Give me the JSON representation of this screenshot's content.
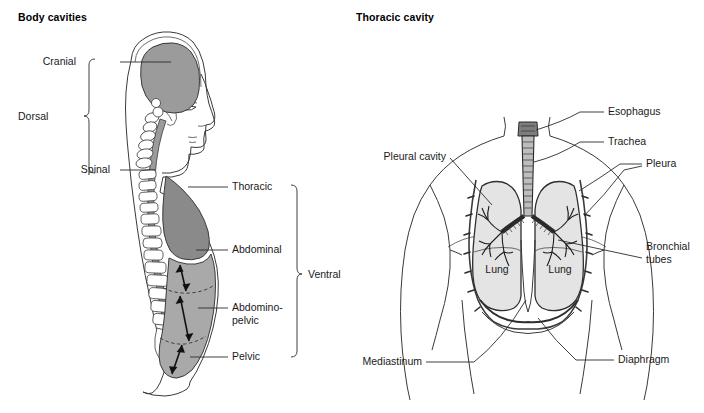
{
  "figure": {
    "type": "anatomical-diagram"
  },
  "panels": {
    "left": {
      "title": "Body cavities",
      "group_labels": [
        {
          "name": "dorsal",
          "text": "Dorsal"
        },
        {
          "name": "ventral",
          "text": "Ventral"
        }
      ],
      "cavity_labels": [
        {
          "name": "cranial",
          "text": "Cranial"
        },
        {
          "name": "spinal",
          "text": "Spinal"
        },
        {
          "name": "thoracic",
          "text": "Thoracic"
        },
        {
          "name": "abdominal",
          "text": "Abdominal"
        },
        {
          "name": "abdominopelvic",
          "text": "Abdomino-",
          "text2": "pelvic"
        },
        {
          "name": "pelvic",
          "text": "Pelvic"
        }
      ]
    },
    "right": {
      "title": "Thoracic cavity",
      "structure_labels": [
        {
          "name": "pleural-cavity",
          "text": "Pleural cavity"
        },
        {
          "name": "esophagus",
          "text": "Esophagus"
        },
        {
          "name": "trachea",
          "text": "Trachea"
        },
        {
          "name": "pleura",
          "text": "Pleura"
        },
        {
          "name": "bronchial-tubes",
          "text": "Bronchial",
          "text2": "tubes"
        },
        {
          "name": "mediastinum",
          "text": "Mediastinum"
        },
        {
          "name": "diaphragm",
          "text": "Diaphragm"
        }
      ],
      "organ_labels": [
        {
          "name": "lung-left",
          "text": "Lung"
        },
        {
          "name": "lung-right",
          "text": "Lung"
        }
      ]
    }
  },
  "colors": {
    "cavity_dark_gray": "#8a8a8a",
    "cavity_light_gray": "#a9a9a9",
    "brain_gray": "#9b9b9b",
    "lung_fill": "#e4e4e4",
    "outline": "#3a3a3a",
    "text": "#1a1a1a",
    "background": "#ffffff"
  }
}
